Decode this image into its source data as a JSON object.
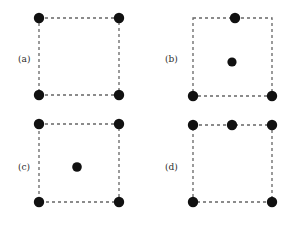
{
  "figure": {
    "background_color": "#ffffff",
    "dot_color": "#111111",
    "dash_color": "#666666",
    "label_color": "#2b2b2b",
    "dot_radius": 5.0,
    "center_dot_radius": 4.6,
    "dash_pattern": "3,3",
    "dash_width": 1.3,
    "panels": [
      {
        "id": "a",
        "label": "(a)",
        "label_x": 18,
        "label_y": 62,
        "square": {
          "x": 39,
          "y": 18,
          "width": 80,
          "height": 77
        },
        "dot_count": 4,
        "dots": [
          {
            "name": "top-left",
            "x": 39,
            "y": 18,
            "r": 5.2
          },
          {
            "name": "top-right",
            "x": 119,
            "y": 18,
            "r": 5.2
          },
          {
            "name": "bottom-left",
            "x": 39,
            "y": 95,
            "r": 5.2
          },
          {
            "name": "bottom-right",
            "x": 119,
            "y": 95,
            "r": 5.2
          }
        ]
      },
      {
        "id": "b",
        "label": "(b)",
        "label_x": 165,
        "label_y": 62,
        "square": {
          "x": 193,
          "y": 18,
          "width": 79,
          "height": 78
        },
        "dot_count": 4,
        "dots": [
          {
            "name": "top-center",
            "x": 235,
            "y": 18,
            "r": 5.2
          },
          {
            "name": "interior",
            "x": 232,
            "y": 62,
            "r": 4.6
          },
          {
            "name": "bottom-left",
            "x": 193,
            "y": 96,
            "r": 5.2
          },
          {
            "name": "bottom-right",
            "x": 272,
            "y": 96,
            "r": 5.2
          }
        ]
      },
      {
        "id": "c",
        "label": "(c)",
        "label_x": 18,
        "label_y": 170,
        "square": {
          "x": 39,
          "y": 124,
          "width": 80,
          "height": 78
        },
        "dot_count": 5,
        "dots": [
          {
            "name": "top-left",
            "x": 39,
            "y": 124,
            "r": 5.2
          },
          {
            "name": "top-right",
            "x": 119,
            "y": 124,
            "r": 5.2
          },
          {
            "name": "interior",
            "x": 77,
            "y": 167,
            "r": 4.8
          },
          {
            "name": "bottom-left",
            "x": 39,
            "y": 202,
            "r": 5.2
          },
          {
            "name": "bottom-right",
            "x": 119,
            "y": 202,
            "r": 5.2
          }
        ]
      },
      {
        "id": "d",
        "label": "(d)",
        "label_x": 165,
        "label_y": 170,
        "square": {
          "x": 193,
          "y": 125,
          "width": 79,
          "height": 77
        },
        "dot_count": 5,
        "dots": [
          {
            "name": "top-left",
            "x": 193,
            "y": 125,
            "r": 5.2
          },
          {
            "name": "top-center",
            "x": 232,
            "y": 125,
            "r": 5.2
          },
          {
            "name": "top-right",
            "x": 272,
            "y": 125,
            "r": 5.2
          },
          {
            "name": "bottom-left",
            "x": 193,
            "y": 202,
            "r": 5.2
          },
          {
            "name": "bottom-right",
            "x": 272,
            "y": 202,
            "r": 5.2
          }
        ]
      }
    ]
  }
}
